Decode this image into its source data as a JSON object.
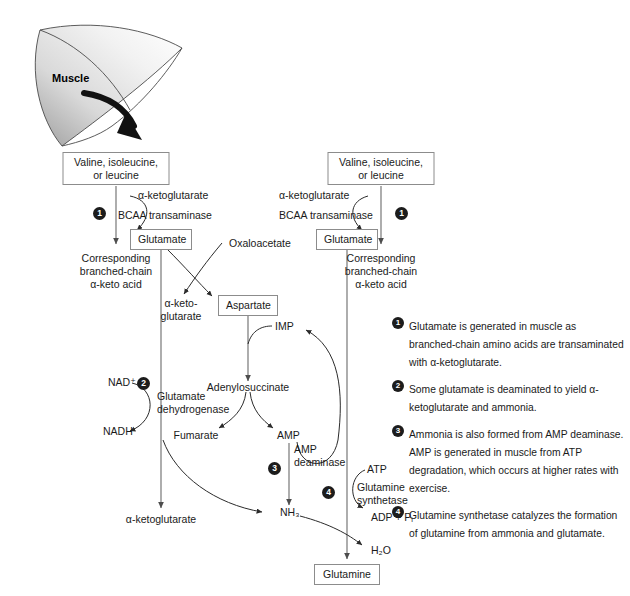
{
  "figure": {
    "source_organ": "Muscle"
  },
  "nodes": {
    "bcaa_left": "Valine, isoleucine,\nor leucine",
    "bcaa_right": "Valine, isoleucine,\nor leucine",
    "glutamate_left": "Glutamate",
    "glutamate_right": "Glutamate",
    "aspartate": "Aspartate",
    "glutamine": "Glutamine"
  },
  "labels": {
    "akg_left": "α-ketoglutarate",
    "akg_right": "α-ketoglutarate",
    "bcaa_transaminase_left": "BCAA transaminase",
    "bcaa_transaminase_right": "BCAA transaminase",
    "keto_acid_left_l1": "Corresponding",
    "keto_acid_left_l2": "branched-chain",
    "keto_acid_left_l3": "α-keto acid",
    "keto_acid_right_l1": "Corresponding",
    "keto_acid_right_l2": "branched-chain",
    "keto_acid_right_l3": "α-keto acid",
    "oxaloacetate": "Oxaloacetate",
    "akg_mid_l1": "α-keto-",
    "akg_mid_l2": "glutarate",
    "imp": "IMP",
    "adenylosuccinate": "Adenylosuccinate",
    "nad_plus": "NAD⁺",
    "nadh": "NADH",
    "glutamate_dehydrogenase_l1": "Glutamate",
    "glutamate_dehydrogenase_l2": "dehydrogenase",
    "fumarate": "Fumarate",
    "amp": "AMP",
    "amp_deaminase_l1": "AMP",
    "amp_deaminase_l2": "deaminase",
    "akg_bottom": "α-ketoglutarate",
    "nh3": "NH₃",
    "atp": "ATP",
    "glutamine_synthetase_l1": "Glutamine",
    "glutamine_synthetase_l2": "synthetase",
    "adp_pi": "ADP + Pᵢ",
    "h2o": "H₂O"
  },
  "step_badges": {
    "b1_left": "1",
    "b1_right": "1",
    "b2": "2",
    "b3": "3",
    "b4": "4"
  },
  "legend": [
    {
      "number": "1",
      "text": "Glutamate is generated in muscle as branched-chain amino acids are transaminated with α-ketoglutarate."
    },
    {
      "number": "2",
      "text": "Some glutamate is deaminated to yield α-ketoglutarate and ammonia."
    },
    {
      "number": "3",
      "text": "Ammonia is also formed from AMP deaminase. AMP is generated in muscle from ATP degradation, which occurs at higher rates with exercise."
    },
    {
      "number": "4",
      "text": "Glutamine synthetase catalyzes the formation of glutamine from ammonia and glutamate."
    }
  ],
  "colors": {
    "background": "#ffffff",
    "text": "#1a1a1a",
    "box_border": "#8c8c8c",
    "arrow": "#4d4d4d",
    "badge_fill": "#1c1c1c",
    "muscle_fill_light": "#fdfdfd",
    "muscle_fill_dark": "#b8b8b8"
  }
}
